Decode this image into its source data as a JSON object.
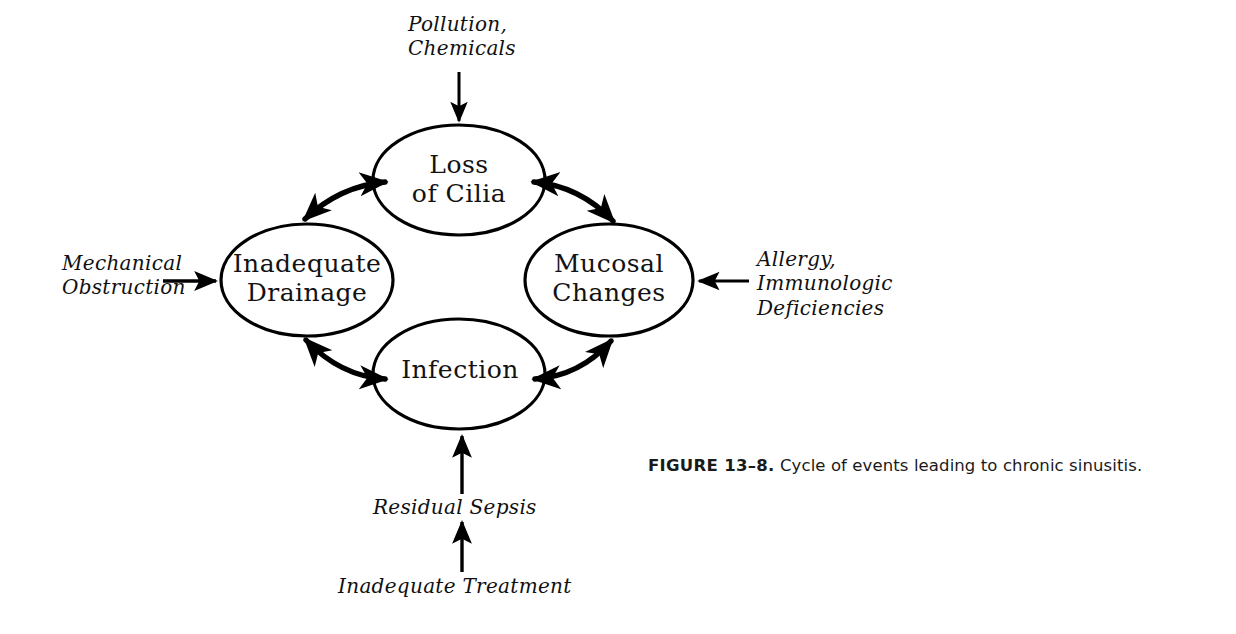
{
  "figure": {
    "caption_number": "FIGURE 13–8.",
    "caption_text": " Cycle of events leading to chronic sinusitis."
  },
  "diagram": {
    "type": "cycle-diagram",
    "nodes": [
      {
        "id": "loss-of-cilia",
        "label": "Loss\nof Cilia",
        "position": "top"
      },
      {
        "id": "inadequate-drainage",
        "label": "Inadequate\nDrainage",
        "position": "left"
      },
      {
        "id": "mucosal-changes",
        "label": "Mucosal\nChanges",
        "position": "right"
      },
      {
        "id": "infection",
        "label": "Infection",
        "position": "bottom"
      }
    ],
    "annotations": [
      {
        "id": "pollution-chemicals",
        "label": "Pollution,\nChemicals",
        "target": "loss-of-cilia",
        "direction": "down"
      },
      {
        "id": "mechanical-obstruction",
        "label": "Mechanical\nObstruction",
        "target": "inadequate-drainage",
        "direction": "right"
      },
      {
        "id": "allergy-immunologic",
        "label": "Allergy,\nImmunologic\nDeficiencies",
        "target": "mucosal-changes",
        "direction": "left"
      },
      {
        "id": "residual-sepsis",
        "label": "Residual  Sepsis",
        "target": "infection",
        "direction": "up"
      },
      {
        "id": "inadequate-treatment",
        "label": "Inadequate  Treatment",
        "target": "residual-sepsis",
        "direction": "up"
      }
    ],
    "links": [
      {
        "from": "inadequate-drainage",
        "to": "loss-of-cilia",
        "style": "double-headed-curved-arrow"
      },
      {
        "from": "loss-of-cilia",
        "to": "mucosal-changes",
        "style": "double-headed-curved-arrow"
      },
      {
        "from": "inadequate-drainage",
        "to": "infection",
        "style": "double-headed-curved-arrow"
      },
      {
        "from": "infection",
        "to": "mucosal-changes",
        "style": "double-headed-curved-arrow"
      }
    ],
    "colors": {
      "stroke": "#000000",
      "background": "#ffffff",
      "text": "#111111"
    }
  }
}
